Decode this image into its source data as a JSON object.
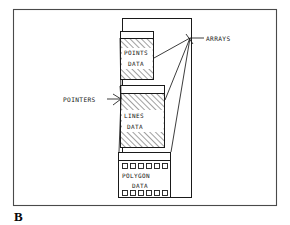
{
  "figure": {
    "panel_letter": "B",
    "frame": {
      "color": "#4a4a4a",
      "x": 13,
      "y": 9,
      "width": 264,
      "height": 197
    },
    "ink_color": "#1a1a1a",
    "hatch_color": "#2b2b2b",
    "background": "#ffffff"
  },
  "container": {
    "name": "array-container",
    "x": 122,
    "y": 18,
    "width": 70,
    "height": 180
  },
  "blocks": [
    {
      "id": "points",
      "label_line1": "POINTS",
      "label_line2": "DATA",
      "header_x": 120,
      "header_y": 31,
      "header_w": 34,
      "header_h": 7,
      "body_x": 120,
      "body_y": 38,
      "body_w": 34,
      "body_h": 42,
      "hatched": true
    },
    {
      "id": "lines",
      "label_line1": "LINES",
      "label_line2": "DATA",
      "header_x": 120,
      "header_y": 85,
      "header_w": 45,
      "header_h": 8,
      "body_x": 120,
      "body_y": 93,
      "body_w": 45,
      "body_h": 55,
      "hatched": true
    },
    {
      "id": "polygon",
      "label_line1": "POLYGON",
      "label_line2": "DATA",
      "header_x": 118,
      "header_y": 152,
      "header_w": 53,
      "header_h": 8,
      "body_x": 118,
      "body_y": 160,
      "body_w": 53,
      "body_h": 38,
      "hatched": false,
      "cell_rows": 2,
      "cells_per_row": 6
    }
  ],
  "annotations": [
    {
      "id": "arrays",
      "label": "ARRAYS",
      "label_x": 206,
      "label_y": 40,
      "anchor_x": 190,
      "anchor_y": 38,
      "targets": [
        {
          "x": 154,
          "y": 58
        },
        {
          "x": 165,
          "y": 100
        },
        {
          "x": 171,
          "y": 152
        }
      ]
    },
    {
      "id": "pointers",
      "label": "POINTERS",
      "label_x": 63,
      "label_y": 101,
      "anchor_x": 121,
      "anchor_y": 99,
      "targets": [
        {
          "x": 120,
          "y": 38
        },
        {
          "x": 120,
          "y": 86
        },
        {
          "x": 119,
          "y": 152
        }
      ]
    }
  ],
  "legend": {
    "hatch_pattern": "diagonal-up-right",
    "line_weight_px": 1
  }
}
